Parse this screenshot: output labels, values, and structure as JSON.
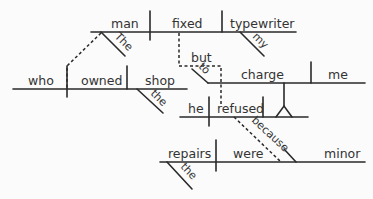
{
  "diagram": {
    "type": "sentence-diagram",
    "clauses": {
      "main": {
        "subject": "man",
        "verb": "fixed",
        "object": "typewriter",
        "modifiers": {
          "man": "The",
          "typewriter": "my"
        }
      },
      "relative": {
        "subject": "who",
        "verb": "owned",
        "object": "shop",
        "modifiers": {
          "shop": "the"
        }
      },
      "coordinate": {
        "conjunction": "but",
        "subject": "he",
        "verb": "refused",
        "object_infinitive": {
          "marker": "to",
          "verb": "charge",
          "object": "me"
        }
      },
      "subordinate": {
        "conjunction": "because",
        "subject": "repairs",
        "verb": "were",
        "complement": "minor",
        "modifiers": {
          "repairs": "the"
        }
      }
    },
    "words": {
      "man": "man",
      "fixed": "fixed",
      "typewriter": "typewriter",
      "the_cap": "The",
      "my": "my",
      "who": "who",
      "owned": "owned",
      "shop": "shop",
      "the1": "the",
      "but": "but",
      "to": "to",
      "charge": "charge",
      "me": "me",
      "he": "he",
      "refused": "refused",
      "because": "because",
      "repairs": "repairs",
      "were": "were",
      "minor": "minor",
      "the2": "the"
    },
    "colors": {
      "ink": "#2a2a2a",
      "background": "#fbfbfb"
    }
  }
}
